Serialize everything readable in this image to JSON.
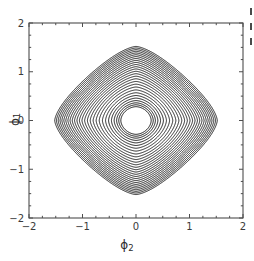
{
  "figure": {
    "title_main": "f(",
    "title_phi1": "ϕ",
    "title_sub1": "1",
    "title_comma": ",",
    "title_phi2": "ϕ",
    "title_sub2": "2",
    "title_close": ")",
    "background_color": "#ffffff",
    "line_color": "#1a1a1a",
    "frame_color": "#4d4d4d"
  },
  "axes": {
    "x_label_glyph": "ϕ",
    "x_label_sub": "2",
    "y_label_glyph": "ϕ",
    "y_label_sub": "1",
    "x_ticks": [
      "-2",
      "-1",
      "0",
      "1",
      "2"
    ],
    "y_ticks": [
      "2",
      "1",
      "0",
      "-1",
      "-2"
    ]
  },
  "edge_fragments": {
    "count": 3,
    "note": "cropped glyph fragments at right border"
  },
  "chart_data": {
    "type": "contour",
    "xlabel": "ϕ₂",
    "ylabel": "ϕ₁",
    "xlim": [
      -2,
      2
    ],
    "ylim": [
      -2,
      2
    ],
    "xticks": [
      -2,
      -1,
      0,
      1,
      2
    ],
    "yticks": [
      -2,
      -1,
      0,
      1,
      2
    ],
    "grid": false,
    "legend": "none",
    "colormap": "black contour lines on white",
    "symmetry": "4-fold (C4v): invariant under ϕ₁↔ϕ₂ and sign flips",
    "n_levels": 22,
    "critical_points": [
      {
        "name": "central basin",
        "x": 0.0,
        "y": 0.0,
        "type": "minimum"
      },
      {
        "name": "satellite top",
        "x": 0.0,
        "y": 1.0,
        "type": "minimum"
      },
      {
        "name": "satellite bottom",
        "x": 0.0,
        "y": -1.0,
        "type": "minimum"
      },
      {
        "name": "satellite left",
        "x": -1.0,
        "y": 0.0,
        "type": "minimum"
      },
      {
        "name": "satellite right",
        "x": 1.0,
        "y": 0.0,
        "type": "minimum"
      }
    ],
    "contour_levels_relative": [
      0.05,
      0.12,
      0.2,
      0.3,
      0.42,
      0.55,
      0.68,
      0.78,
      0.86,
      0.92,
      0.96,
      1.0,
      1.05,
      1.1,
      1.15,
      1.2,
      1.26,
      1.32,
      1.38,
      1.45,
      1.52,
      1.6
    ]
  }
}
